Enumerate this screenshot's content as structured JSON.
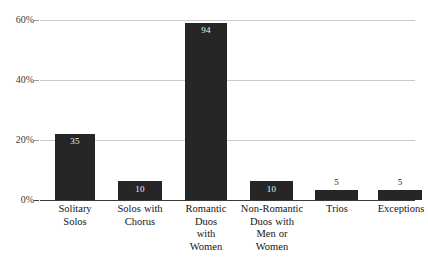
{
  "chart_data": {
    "type": "bar",
    "title": "",
    "subtitle": "",
    "xlabel": "",
    "ylabel": "",
    "categories": [
      "Solitary Solos",
      "Solos with Chorus",
      "Romantic Duos with Women",
      "Non-Romantic Duos with Men or Women",
      "Trios",
      "Exceptions"
    ],
    "values": [
      35,
      10,
      94,
      10,
      5,
      5
    ],
    "value_labels": [
      "35",
      "10",
      "94",
      "10",
      "5",
      "5"
    ],
    "percent_of_total": [
      22.0,
      6.3,
      59.1,
      6.3,
      3.1,
      3.1
    ],
    "ylim": [
      0,
      60
    ],
    "y_ticks": [
      0,
      20,
      40,
      60
    ],
    "y_tick_labels": [
      "0%",
      "20%",
      "40%",
      "60%"
    ],
    "grid": true,
    "legend": "none",
    "bar_color": "#262626",
    "gridline_color": "#c9c9c9",
    "axis_color": "#3a3a3a",
    "value_label_inside_color": "#f2f2f2",
    "value_label_outside_color": "#1a1a1a"
  },
  "y_axis": {
    "ticks": [
      {
        "label": "60%",
        "value": 60
      },
      {
        "label": "40%",
        "value": 40
      },
      {
        "label": "20%",
        "value": 20
      },
      {
        "label": "0%",
        "value": 0
      }
    ]
  },
  "bars": [
    {
      "category": "Solitary Solos",
      "label_lines": "Solitary\nSolos",
      "value": "35",
      "pct": 22.0,
      "label_position": "inside"
    },
    {
      "category": "Solos with Chorus",
      "label_lines": "Solos with\nChorus",
      "value": "10",
      "pct": 6.3,
      "label_position": "inside"
    },
    {
      "category": "Romantic Duos with Women",
      "label_lines": "Romantic\nDuos\nwith\nWomen",
      "value": "94",
      "pct": 59.1,
      "label_position": "inside"
    },
    {
      "category": "Non-Romantic Duos with Men or Women",
      "label_lines": "Non-Romantic\nDuos with\nMen or\nWomen",
      "value": "10",
      "pct": 6.3,
      "label_position": "inside"
    },
    {
      "category": "Trios",
      "label_lines": "Trios",
      "value": "5",
      "pct": 3.1,
      "label_position": "outside"
    },
    {
      "category": "Exceptions",
      "label_lines": "Exceptions",
      "value": "5",
      "pct": 3.1,
      "label_position": "outside"
    }
  ]
}
